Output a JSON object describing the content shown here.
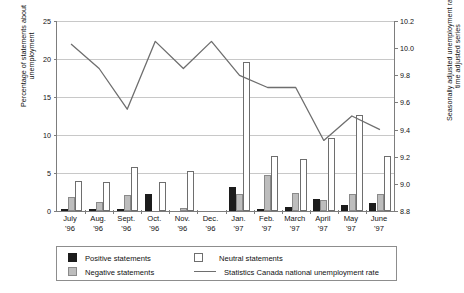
{
  "chart_data": {
    "type": "bar",
    "title": "",
    "categories": [
      "July\n'96",
      "Aug.\n'96",
      "Sept.\n'96",
      "Oct.\n'96",
      "Nov.\n'96",
      "Dec.\n'96",
      "Jan.\n'97",
      "Feb.\n'97",
      "March\n'97",
      "April\n'97",
      "May\n'97",
      "June\n'97"
    ],
    "month_labels": [
      {
        "month": "July",
        "year": "'96"
      },
      {
        "month": "Aug.",
        "year": "'96"
      },
      {
        "month": "Sept.",
        "year": "'96"
      },
      {
        "month": "Oct.",
        "year": "'96"
      },
      {
        "month": "Nov.",
        "year": "'96"
      },
      {
        "month": "Dec.",
        "year": "'96"
      },
      {
        "month": "Jan.",
        "year": "'97"
      },
      {
        "month": "Feb.",
        "year": "'97"
      },
      {
        "month": "March",
        "year": "'97"
      },
      {
        "month": "April",
        "year": "'97"
      },
      {
        "month": "May",
        "year": "'97"
      },
      {
        "month": "June",
        "year": "'97"
      }
    ],
    "series": [
      {
        "name": "Positive statements",
        "color": "#1c1c1c",
        "values": [
          0.3,
          0.2,
          0.3,
          2.3,
          0.0,
          0.0,
          3.2,
          0.3,
          0.5,
          1.6,
          0.8,
          1.0
        ]
      },
      {
        "name": "Negative statements",
        "color": "#bdbdbd",
        "values": [
          1.8,
          1.2,
          2.1,
          0.0,
          0.4,
          0.0,
          2.3,
          4.8,
          2.4,
          1.5,
          2.2,
          2.3
        ]
      },
      {
        "name": "Neutral statements",
        "color": "#ffffff",
        "values": [
          4.0,
          3.8,
          5.8,
          3.8,
          5.3,
          0.0,
          19.6,
          7.3,
          6.9,
          9.6,
          12.6,
          7.2
        ]
      }
    ],
    "line_series": {
      "name": "Statistics Canada national unemployment rate",
      "color": "#6e6e6e",
      "values": [
        10.03,
        9.85,
        9.55,
        10.05,
        9.85,
        10.05,
        9.8,
        9.71,
        9.71,
        9.32,
        9.5,
        9.4
      ]
    },
    "ylabel_left": [
      "Percentage of statements about",
      "unemployment"
    ],
    "ylabel_right": [
      "Seasonally adjusted unemployment rate,",
      "time adjusted series"
    ],
    "ylim_left": [
      0,
      25
    ],
    "yticks_left": [
      "0",
      "5",
      "10",
      "15",
      "20",
      "25"
    ],
    "ylim_right": [
      8.8,
      10.2
    ],
    "yticks_right": [
      "8.8",
      "9.0",
      "9.2",
      "9.4",
      "9.6",
      "9.8",
      "10.0",
      "10.2"
    ],
    "xlabel": "",
    "grid": true,
    "legend_position": "bottom"
  },
  "legend": {
    "positive": "Positive statements",
    "neutral": "Neutral statements",
    "negative": "Negative statements",
    "line": "Statistics Canada national unemployment rate"
  }
}
